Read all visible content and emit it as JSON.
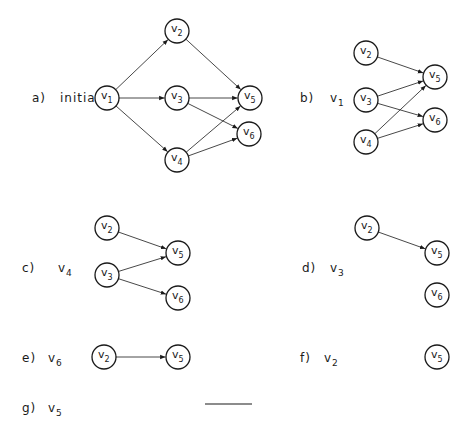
{
  "colors": {
    "ink": "#1a1a1a",
    "edge": "#333333",
    "background": "#ffffff"
  },
  "node_radius": 12,
  "panels": [
    {
      "id": "a",
      "label": "a)",
      "removed": "initial",
      "label_pos": [
        32,
        102
      ],
      "removed_pos": [
        60,
        102
      ],
      "removed_sub": "",
      "nodes": [
        {
          "name": "v",
          "sub": "1",
          "x": 107,
          "y": 98
        },
        {
          "name": "v",
          "sub": "2",
          "x": 177,
          "y": 31
        },
        {
          "name": "v",
          "sub": "3",
          "x": 177,
          "y": 98
        },
        {
          "name": "v",
          "sub": "4",
          "x": 177,
          "y": 160
        },
        {
          "name": "v",
          "sub": "5",
          "x": 250,
          "y": 98
        },
        {
          "name": "v",
          "sub": "6",
          "x": 249,
          "y": 134
        }
      ],
      "edges": [
        [
          0,
          1
        ],
        [
          0,
          2
        ],
        [
          0,
          3
        ],
        [
          1,
          4
        ],
        [
          2,
          4
        ],
        [
          2,
          5
        ],
        [
          3,
          4
        ],
        [
          3,
          5
        ]
      ]
    },
    {
      "id": "b",
      "label": "b)",
      "removed": "v",
      "removed_sub": "1",
      "label_pos": [
        300,
        102
      ],
      "removed_pos": [
        330,
        102
      ],
      "nodes": [
        {
          "name": "v",
          "sub": "2",
          "x": 366,
          "y": 53
        },
        {
          "name": "v",
          "sub": "3",
          "x": 366,
          "y": 100
        },
        {
          "name": "v",
          "sub": "4",
          "x": 366,
          "y": 142
        },
        {
          "name": "v",
          "sub": "5",
          "x": 435,
          "y": 77
        },
        {
          "name": "v",
          "sub": "6",
          "x": 435,
          "y": 120
        }
      ],
      "edges": [
        [
          0,
          3
        ],
        [
          1,
          3
        ],
        [
          1,
          4
        ],
        [
          2,
          3
        ],
        [
          2,
          4
        ]
      ]
    },
    {
      "id": "c",
      "label": "c)",
      "removed": "v",
      "removed_sub": "4",
      "label_pos": [
        22,
        272
      ],
      "removed_pos": [
        58,
        272
      ],
      "nodes": [
        {
          "name": "v",
          "sub": "2",
          "x": 107,
          "y": 228
        },
        {
          "name": "v",
          "sub": "3",
          "x": 107,
          "y": 275
        },
        {
          "name": "v",
          "sub": "5",
          "x": 178,
          "y": 253
        },
        {
          "name": "v",
          "sub": "6",
          "x": 178,
          "y": 298
        }
      ],
      "edges": [
        [
          0,
          2
        ],
        [
          1,
          2
        ],
        [
          1,
          3
        ]
      ]
    },
    {
      "id": "d",
      "label": "d)",
      "removed": "v",
      "removed_sub": "3",
      "label_pos": [
        302,
        272
      ],
      "removed_pos": [
        330,
        272
      ],
      "nodes": [
        {
          "name": "v",
          "sub": "2",
          "x": 367,
          "y": 228
        },
        {
          "name": "v",
          "sub": "5",
          "x": 437,
          "y": 253
        },
        {
          "name": "v",
          "sub": "6",
          "x": 437,
          "y": 295
        }
      ],
      "edges": [
        [
          0,
          1
        ]
      ]
    },
    {
      "id": "e",
      "label": "e)",
      "removed": "v",
      "removed_sub": "6",
      "label_pos": [
        22,
        362
      ],
      "removed_pos": [
        48,
        362
      ],
      "nodes": [
        {
          "name": "v",
          "sub": "2",
          "x": 104,
          "y": 357
        },
        {
          "name": "v",
          "sub": "5",
          "x": 178,
          "y": 357
        }
      ],
      "edges": [
        [
          0,
          1
        ]
      ]
    },
    {
      "id": "f",
      "label": "f)",
      "removed": "v",
      "removed_sub": "2",
      "label_pos": [
        300,
        362
      ],
      "removed_pos": [
        324,
        362
      ],
      "nodes": [
        {
          "name": "v",
          "sub": "5",
          "x": 437,
          "y": 357
        }
      ],
      "edges": []
    },
    {
      "id": "g",
      "label": "g)",
      "removed": "v",
      "removed_sub": "5",
      "label_pos": [
        22,
        412
      ],
      "removed_pos": [
        48,
        412
      ],
      "nodes": [],
      "edges": [],
      "empty_line": [
        205,
        404,
        252,
        404
      ]
    }
  ]
}
